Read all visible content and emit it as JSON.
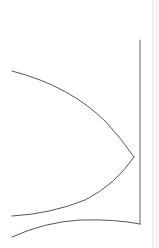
{
  "diagram": {
    "type": "line-drawing",
    "background": "#ffffff",
    "stroke_color": "#555555",
    "vertical_line_color": "#777777",
    "edge_strip_color": "#f4f4f4",
    "shapes": [
      {
        "name": "vertical-line",
        "kind": "line",
        "from": [
          140,
          40
        ],
        "to": [
          140,
          224
        ]
      },
      {
        "name": "upper-curve",
        "kind": "curve",
        "from": [
          12,
          71
        ],
        "to": [
          134,
          157
        ]
      },
      {
        "name": "lower-curve",
        "kind": "curve",
        "from": [
          134,
          157
        ],
        "to": [
          12,
          216
        ]
      },
      {
        "name": "bottom-curve",
        "kind": "curve",
        "from": [
          12,
          237
        ],
        "to": [
          140,
          224
        ]
      }
    ]
  }
}
